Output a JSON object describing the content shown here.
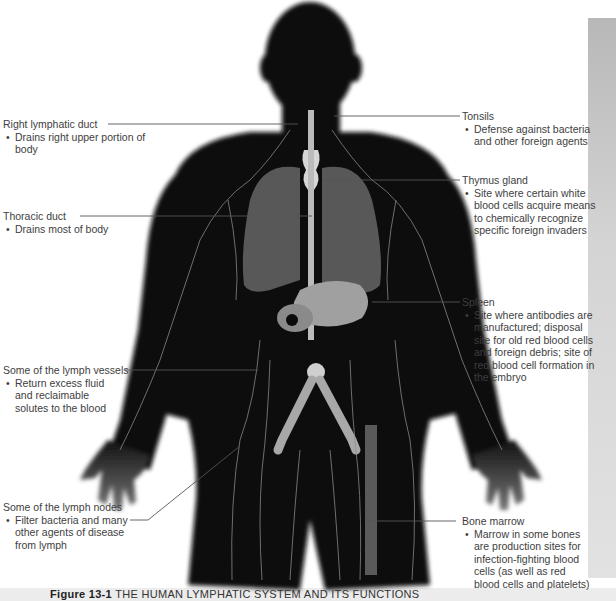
{
  "figure": {
    "number": "Figure 13-1",
    "title": "THE HUMAN LYMPHATIC SYSTEM AND ITS FUNCTIONS"
  },
  "labels": [
    {
      "id": "right-lymphatic-duct",
      "title": "Right lymphatic duct",
      "bullet": "Drains right upper portion of body"
    },
    {
      "id": "thoracic-duct",
      "title": "Thoracic duct",
      "bullet": "Drains most of body"
    },
    {
      "id": "lymph-vessels",
      "title": "Some of the lymph vessels",
      "bullet": "Return excess fluid and reclaimable solutes to the blood"
    },
    {
      "id": "lymph-nodes",
      "title": "Some of the lymph nodes",
      "bullet": "Filter bacteria and many other agents of disease from lymph"
    },
    {
      "id": "tonsils",
      "title": "Tonsils",
      "bullet": "Defense against bacteria and other foreign agents"
    },
    {
      "id": "thymus-gland",
      "title": "Thymus gland",
      "bullet": "Site where certain white blood cells acquire means to chemically recognize specific foreign invaders"
    },
    {
      "id": "spleen",
      "title": "Spleen",
      "bullet": "Site where antibodies are manufactured; disposal site for old red blood cells and foreign debris; site of red blood cell formation in the embryo"
    },
    {
      "id": "bone-marrow",
      "title": "Bone marrow",
      "bullet": "Marrow in some bones are production sites for infection-fighting blood cells (as well as red blood cells and platelets)"
    }
  ],
  "colors": {
    "body": "#0a0a0a",
    "organs": "#6a6a6a",
    "vessels": "#9a9a9a",
    "leader": "#555555",
    "text": "#3e3e3e"
  }
}
